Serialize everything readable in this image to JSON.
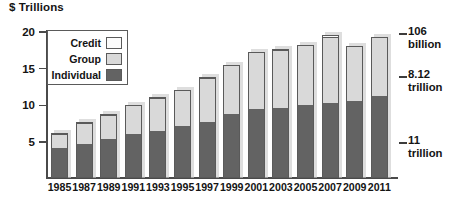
{
  "chart_data": {
    "type": "bar",
    "title": "$ Trillions",
    "subtitle": "",
    "xlabel": "",
    "ylabel": "$ Trillions",
    "ylim": [
      0,
      20
    ],
    "yticks": [
      5,
      10,
      15,
      20
    ],
    "ytick_labels": [
      "5",
      "10",
      "15",
      "20"
    ],
    "grid": false,
    "stacked": true,
    "legend_position": "top-left",
    "categories": [
      "1985",
      "1987",
      "1989",
      "1991",
      "1993",
      "1995",
      "1997",
      "1999",
      "2001",
      "2003",
      "2005",
      "2007",
      "2009",
      "2011"
    ],
    "series": [
      {
        "name": "Individual",
        "color": "#636363",
        "values": [
          3.9,
          4.5,
          5.2,
          5.9,
          6.3,
          6.9,
          7.5,
          8.6,
          9.2,
          9.4,
          9.8,
          10.1,
          10.3,
          11.0
        ]
      },
      {
        "name": "Group",
        "color": "#d9d9d9",
        "values": [
          2.0,
          2.9,
          3.3,
          3.9,
          4.5,
          4.9,
          6.0,
          6.6,
          7.8,
          7.9,
          8.1,
          9.0,
          7.5,
          8.0
        ]
      },
      {
        "name": "Credit",
        "color": "#fbfbfb",
        "values": [
          0.2,
          0.2,
          0.2,
          0.2,
          0.2,
          0.2,
          0.2,
          0.2,
          0.2,
          0.2,
          0.2,
          0.3,
          0.2,
          0.12
        ]
      }
    ],
    "totals": [
      6.1,
      7.6,
      8.7,
      10.0,
      11.0,
      12.0,
      13.7,
      15.4,
      17.2,
      17.5,
      18.1,
      19.4,
      18.0,
      19.1
    ],
    "annotations": [
      {
        "id": "credit-annotation",
        "value_line1": "106",
        "value_line2": "billion"
      },
      {
        "id": "group-annotation",
        "value_line1": "8.12",
        "value_line2": "trillion"
      },
      {
        "id": "individual-annotation",
        "value_line1": "11",
        "value_line2": "trillion"
      }
    ]
  },
  "legend": {
    "items": [
      {
        "label": "Credit",
        "swatch": "credit"
      },
      {
        "label": "Group",
        "swatch": "group"
      },
      {
        "label": "Individual",
        "swatch": "individual"
      }
    ]
  },
  "colors": {
    "individual": "#636363",
    "group": "#d9d9d9",
    "credit": "#fbfbfb",
    "outline": "#5a5a5a",
    "text": "#141414"
  }
}
